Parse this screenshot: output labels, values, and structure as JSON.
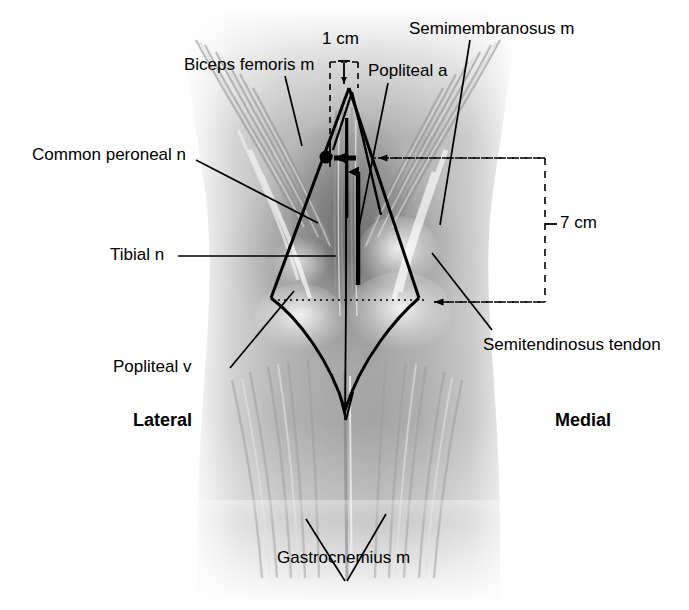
{
  "figure": {
    "background_color": "#ffffff",
    "line_color": "#000000",
    "width": 689,
    "height": 610
  },
  "labels": {
    "biceps_femoris": "Biceps femoris m",
    "common_peroneal": "Common peroneal n",
    "tibial_n": "Tibial n",
    "popliteal_v": "Popliteal v",
    "popliteal_a": "Popliteal a",
    "semimembranosus": "Semimembranosus m",
    "semitendinosus": "Semitendinosus tendon",
    "gastrocnemius": "Gastrocnemius m",
    "lateral": "Lateral",
    "medial": "Medial"
  },
  "measurements": {
    "top": "1 cm",
    "right": "7 cm"
  },
  "icons": {
    "peroneal_marker": "dot-marker",
    "incision_arrow": "arrow-up",
    "reference_arrow": "arrow-left",
    "dashed_pointer": "dashed-arrow-left",
    "vertical_pointer": "arrow-down"
  }
}
